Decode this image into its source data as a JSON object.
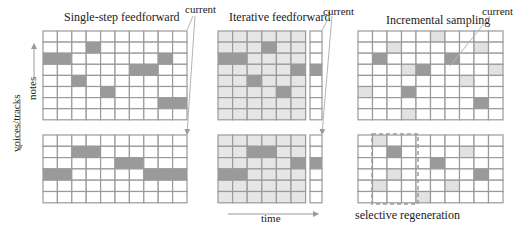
{
  "panels": {
    "single": {
      "title": "Single-step feedforward",
      "current_label": "current"
    },
    "iterative": {
      "title": "Iterative feedforward",
      "current_label": "current"
    },
    "incremental": {
      "title": "Incremental sampling",
      "current_label": "current"
    }
  },
  "axes": {
    "notes_label": "notes",
    "voices_label": "voices/tracks",
    "time_label": "time"
  },
  "annotations": {
    "selective_regeneration": "selective regeneration"
  },
  "colors": {
    "grid_line": "#9a9a9a",
    "dark_cell": "#9a9a9a",
    "light_cell": "#e2e2e2",
    "bg_iterative": "#e6e6e6",
    "white": "#ffffff",
    "arrow": "#b5b5b5"
  },
  "grids": [
    {
      "id": "single-top",
      "x": 43,
      "y": 31,
      "cols": 10,
      "rows": 8,
      "cw": 14.4,
      "ch": 11.1,
      "bg": "white",
      "dark": [
        [
          0,
          2
        ],
        [
          1,
          2
        ],
        [
          3,
          1
        ],
        [
          8,
          2
        ],
        [
          6,
          3
        ],
        [
          7,
          3
        ],
        [
          2,
          4
        ],
        [
          4,
          5
        ],
        [
          8,
          6
        ],
        [
          9,
          6
        ]
      ],
      "light": []
    },
    {
      "id": "single-bottom",
      "x": 43,
      "y": 135,
      "cols": 10,
      "rows": 6,
      "cw": 14.4,
      "ch": 11.3,
      "bg": "white",
      "dark": [
        [
          2,
          1
        ],
        [
          3,
          1
        ],
        [
          5,
          2
        ],
        [
          6,
          2
        ],
        [
          0,
          3
        ],
        [
          1,
          3
        ],
        [
          7,
          3
        ],
        [
          8,
          3
        ],
        [
          9,
          3
        ]
      ],
      "light": []
    },
    {
      "id": "iter-top",
      "x": 218,
      "y": 31,
      "cols": 6,
      "rows": 8,
      "cw": 14.6,
      "ch": 11.1,
      "bg": "bg_iterative",
      "dark": [
        [
          3,
          1
        ],
        [
          0,
          2
        ],
        [
          1,
          2
        ],
        [
          5,
          3
        ],
        [
          2,
          4
        ],
        [
          4,
          5
        ]
      ],
      "light": []
    },
    {
      "id": "iter-top-current",
      "x": 310,
      "y": 31,
      "cols": 1,
      "rows": 8,
      "cw": 12,
      "ch": 11.1,
      "bg": "white",
      "dark": [
        [
          0,
          3
        ]
      ],
      "light": []
    },
    {
      "id": "iter-bottom",
      "x": 218,
      "y": 135,
      "cols": 6,
      "rows": 6,
      "cw": 14.6,
      "ch": 11.3,
      "bg": "bg_iterative",
      "dark": [
        [
          2,
          1
        ],
        [
          3,
          1
        ],
        [
          5,
          2
        ],
        [
          0,
          3
        ],
        [
          1,
          3
        ]
      ],
      "light": []
    },
    {
      "id": "iter-bottom-current",
      "x": 310,
      "y": 135,
      "cols": 1,
      "rows": 6,
      "cw": 12,
      "ch": 11.3,
      "bg": "white",
      "dark": [
        [
          0,
          2
        ]
      ],
      "light": []
    },
    {
      "id": "inc-top",
      "x": 358,
      "y": 31,
      "cols": 10,
      "rows": 8,
      "cw": 14.5,
      "ch": 11.1,
      "bg": "white",
      "dark": [
        [
          1,
          2
        ],
        [
          6,
          2
        ],
        [
          4,
          3
        ],
        [
          3,
          5
        ],
        [
          8,
          6
        ]
      ],
      "light": [
        [
          5,
          0
        ],
        [
          2,
          1
        ],
        [
          8,
          1
        ],
        [
          3,
          3
        ],
        [
          9,
          3
        ],
        [
          7,
          4
        ],
        [
          0,
          5
        ],
        [
          3,
          7
        ]
      ]
    },
    {
      "id": "inc-bottom",
      "x": 358,
      "y": 135,
      "cols": 10,
      "rows": 6,
      "cw": 14.5,
      "ch": 11.3,
      "bg": "white",
      "dark": [
        [
          2,
          1
        ],
        [
          5,
          2
        ],
        [
          8,
          3
        ]
      ],
      "light": [
        [
          1,
          0
        ],
        [
          7,
          1
        ],
        [
          2,
          3
        ],
        [
          1,
          4
        ],
        [
          6,
          4
        ],
        [
          4,
          5
        ]
      ]
    }
  ],
  "selection_box": {
    "x": 372,
    "y": 134,
    "w": 46,
    "h": 70
  }
}
